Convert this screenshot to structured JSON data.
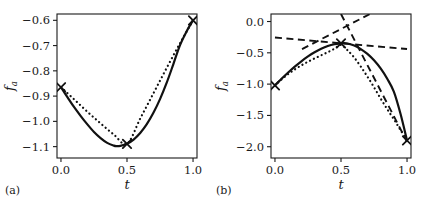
{
  "figure": {
    "width": 422,
    "height": 209,
    "background": "#ffffff",
    "ink_color": "#111111"
  },
  "chart_data": [
    {
      "type": "line",
      "panel_label": "(a)",
      "title": "",
      "xlabel": "t",
      "ylabel": "f",
      "ylabel_subscript": "a",
      "xlim": [
        -0.03,
        1.03
      ],
      "ylim": [
        -1.145,
        -0.575
      ],
      "xticks": [
        0.0,
        0.5,
        1.0
      ],
      "xtick_labels": [
        "0.0",
        "0.5",
        "1.0"
      ],
      "yticks": [
        -0.6,
        -0.7,
        -0.8,
        -0.9,
        -1.0,
        -1.1
      ],
      "ytick_labels": [
        "-0.6",
        "-0.7",
        "-0.8",
        "-0.9",
        "-1.0",
        "-1.1"
      ],
      "grid": false,
      "legend": "none",
      "series": [
        {
          "name": "true-objective",
          "style": "solid",
          "x": [
            0.0,
            0.05,
            0.1,
            0.15,
            0.2,
            0.25,
            0.3,
            0.35,
            0.4,
            0.42,
            0.45,
            0.5,
            0.55,
            0.6,
            0.65,
            0.7,
            0.75,
            0.8,
            0.85,
            0.9,
            0.95,
            1.0
          ],
          "y": [
            -0.865,
            -0.905,
            -0.944,
            -0.979,
            -1.012,
            -1.042,
            -1.066,
            -1.085,
            -1.096,
            -1.098,
            -1.097,
            -1.089,
            -1.072,
            -1.046,
            -1.011,
            -0.966,
            -0.912,
            -0.848,
            -0.775,
            -0.7,
            -0.645,
            -0.6
          ]
        },
        {
          "name": "surrogate-model",
          "style": "dotted",
          "x": [
            0.0,
            0.1,
            0.2,
            0.3,
            0.4,
            0.5,
            0.6,
            0.7,
            0.8,
            0.9,
            1.0
          ],
          "y": [
            -0.865,
            -0.913,
            -0.962,
            -1.008,
            -1.052,
            -1.089,
            -0.989,
            -0.889,
            -0.789,
            -0.692,
            -0.6
          ]
        }
      ],
      "markers": [
        {
          "name": "sample-point",
          "x": 0.0,
          "y": -0.865
        },
        {
          "name": "sample-point",
          "x": 0.5,
          "y": -1.089
        },
        {
          "name": "sample-point",
          "x": 1.0,
          "y": -0.6
        }
      ]
    },
    {
      "type": "line",
      "panel_label": "(b)",
      "title": "",
      "xlabel": "t",
      "ylabel": "f",
      "ylabel_subscript": "a",
      "xlim": [
        -0.03,
        1.03
      ],
      "ylim": [
        -2.18,
        0.12
      ],
      "xticks": [
        0.0,
        0.5,
        1.0
      ],
      "xtick_labels": [
        "0.0",
        "0.5",
        "1.0"
      ],
      "yticks": [
        0.0,
        -0.5,
        -1.0,
        -1.5,
        -2.0
      ],
      "ytick_labels": [
        "0.0",
        "-0.5",
        "-1.0",
        "-1.5",
        "-2.0"
      ],
      "grid": false,
      "legend": "none",
      "series": [
        {
          "name": "true-objective",
          "style": "solid",
          "x": [
            0.0,
            0.05,
            0.1,
            0.15,
            0.2,
            0.25,
            0.3,
            0.35,
            0.4,
            0.45,
            0.5,
            0.52,
            0.55,
            0.6,
            0.65,
            0.7,
            0.75,
            0.8,
            0.85,
            0.9,
            0.95,
            1.0
          ],
          "y": [
            -1.02,
            -0.915,
            -0.815,
            -0.72,
            -0.635,
            -0.558,
            -0.49,
            -0.435,
            -0.392,
            -0.363,
            -0.348,
            -0.346,
            -0.352,
            -0.384,
            -0.44,
            -0.518,
            -0.62,
            -0.75,
            -0.915,
            -1.12,
            -1.47,
            -1.9
          ]
        },
        {
          "name": "surrogate-model",
          "style": "dotted",
          "x": [
            0.0,
            0.05,
            0.1,
            0.15,
            0.2,
            0.25,
            0.3,
            0.35,
            0.4,
            0.45,
            0.5,
            0.55,
            0.6,
            0.65,
            0.7,
            0.75,
            0.8,
            0.85,
            0.9,
            0.95,
            1.0
          ],
          "y": [
            -1.02,
            -0.925,
            -0.84,
            -0.765,
            -0.7,
            -0.642,
            -0.59,
            -0.54,
            -0.49,
            -0.435,
            -0.375,
            -0.46,
            -0.575,
            -0.72,
            -0.88,
            -1.05,
            -1.23,
            -1.4,
            -1.56,
            -1.73,
            -1.9
          ]
        },
        {
          "name": "tangent-shallow",
          "style": "dashed",
          "x": [
            0.0,
            1.0
          ],
          "y": [
            -0.255,
            -0.44
          ]
        },
        {
          "name": "tangent-rising",
          "style": "dashed",
          "x": [
            0.205,
            0.72
          ],
          "y": [
            -0.44,
            0.12
          ]
        },
        {
          "name": "tangent-falling",
          "style": "dashed",
          "x": [
            0.5,
            1.0
          ],
          "y": [
            0.12,
            -1.92
          ]
        }
      ],
      "markers": [
        {
          "name": "sample-point",
          "x": 0.0,
          "y": -1.02
        },
        {
          "name": "sample-point",
          "x": 0.5,
          "y": -0.35
        },
        {
          "name": "sample-point",
          "x": 1.0,
          "y": -1.9
        }
      ]
    }
  ]
}
